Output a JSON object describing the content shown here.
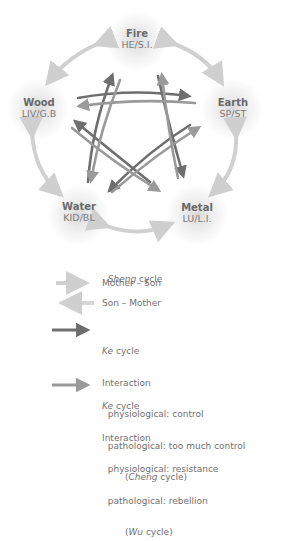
{
  "diagram": {
    "nodes": [
      {
        "id": "fire",
        "name": "Fire",
        "organs": "HE/S.I."
      },
      {
        "id": "earth",
        "name": "Earth",
        "organs": "SP/ST"
      },
      {
        "id": "metal",
        "name": "Metal",
        "organs": "LU/L.I."
      },
      {
        "id": "water",
        "name": "Water",
        "organs": "KID/BL"
      },
      {
        "id": "wood",
        "name": "Wood",
        "organs": "LIV/G.B"
      }
    ],
    "colors": {
      "sheng_mother_son": "#c8c8c8",
      "sheng_son_mother": "#d6d6d6",
      "ke_cheng": "#6e6e6e",
      "ke_wu": "#9a9a9a",
      "text": "#707070"
    }
  },
  "legend": {
    "sheng": {
      "title_italic": "Sheng",
      "title_rest": " cycle",
      "mother_son": "Mother – Son",
      "son_mother": "Son – Mother"
    },
    "ke_cheng": {
      "title_italic": "Ke",
      "title_rest": " cycle",
      "line1": "Interaction",
      "line2": "  physiological: control",
      "line3": "  pathological: too much control",
      "cycle_open": "        (",
      "cycle_italic": "Cheng",
      "cycle_rest": " cycle)"
    },
    "ke_wu": {
      "title_italic": "Ke",
      "title_rest": " cycle",
      "line1": "Interaction",
      "line2": "  physiological: resistance",
      "line3": "  pathological: rebellion",
      "cycle_open": "        (",
      "cycle_italic": "Wu",
      "cycle_rest": " cycle)"
    }
  }
}
